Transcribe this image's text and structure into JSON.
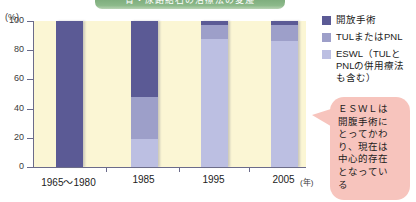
{
  "banner": {
    "text": "腎・尿路結石の治療法の変遷"
  },
  "axes": {
    "y_unit": "(%)",
    "x_unit": "(年)",
    "y_ticks": [
      0,
      20,
      40,
      60,
      80,
      100
    ],
    "x_categories": [
      "1965〜1980",
      "1985",
      "1995",
      "2005"
    ]
  },
  "legend": {
    "items": [
      {
        "label": "開放手術",
        "color": "#5b5a95",
        "key": "open"
      },
      {
        "label": "TULまたはPNL",
        "color": "#9d9fc9",
        "key": "tul"
      },
      {
        "label": "ESWL（TULと\nPNLの併用療法\nも含む）",
        "color": "#bcbfe2",
        "key": "eswl"
      }
    ]
  },
  "callout": {
    "text": "ＥＳＷＬは\n開腹手術に\nとってかわ\nり、現在は\n中心的存在\nとなってい\nる",
    "color": "#f7c4bd"
  },
  "chart_data": {
    "type": "bar",
    "stacked": true,
    "title": "腎・尿路結石の治療法の変遷",
    "xlabel": "(年)",
    "ylabel": "(%)",
    "ylim": [
      0,
      100
    ],
    "grid": false,
    "legend_position": "right",
    "categories": [
      "1965〜1980",
      "1985",
      "1995",
      "2005"
    ],
    "series": [
      {
        "name": "開放手術",
        "color": "#5b5a95",
        "values": [
          100,
          52,
          3,
          3
        ]
      },
      {
        "name": "TULまたはPNL",
        "color": "#9d9fc9",
        "values": [
          0,
          29,
          9,
          11
        ]
      },
      {
        "name": "ESWL（TULとPNLの併用療法も含む）",
        "color": "#bcbfe2",
        "values": [
          0,
          19,
          88,
          86
        ]
      }
    ]
  }
}
